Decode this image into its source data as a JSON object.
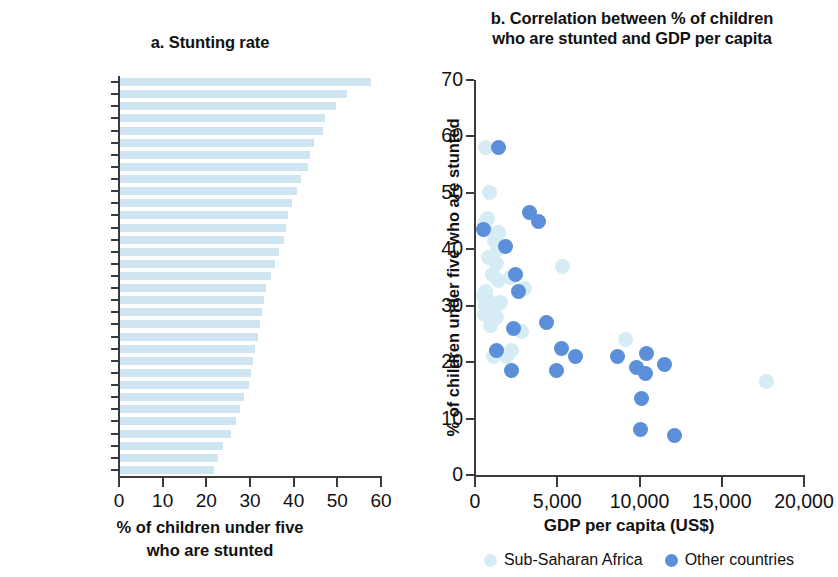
{
  "chart_data": [
    {
      "type": "bar",
      "title": "a. Stunting rate",
      "xlabel": "% of children under five who are stunted",
      "xlabel_lines": [
        "% of children under five",
        "who are stunted"
      ],
      "ylabel": "",
      "orientation": "horizontal",
      "xlim": [
        0,
        60
      ],
      "xticks": [
        0,
        10,
        20,
        30,
        40,
        50,
        60
      ],
      "xticklabels": [
        "0",
        "10",
        "20",
        "30",
        "40",
        "50",
        "60"
      ],
      "grid": false,
      "bar_color": "#cfe6f2",
      "labeled_categories": [
        "Madagascar",
        "Ethiopia",
        "Tanzania",
        "Mali",
        "Nigeria",
        "Lesotho",
        "Liberia",
        "Côte d’Ivoire",
        "Kenya",
        "Namibia",
        "Gabon"
      ],
      "labeled_category_indices": [
        1,
        4,
        7,
        10,
        13,
        16,
        19,
        22,
        25,
        28,
        31
      ],
      "values": [
        57.5,
        52.0,
        49.5,
        47.0,
        46.5,
        44.5,
        43.5,
        43.0,
        41.5,
        40.5,
        39.5,
        38.5,
        38.0,
        37.5,
        36.5,
        35.5,
        34.5,
        33.5,
        33.0,
        32.5,
        32.0,
        31.5,
        31.0,
        30.5,
        30.0,
        29.5,
        28.5,
        27.5,
        26.5,
        25.5,
        23.5,
        22.5,
        21.5
      ]
    },
    {
      "type": "scatter",
      "title": "b. Correlation between % of children who are stunted and GDP per capita",
      "title_lines": [
        "b. Correlation between % of children",
        "who are stunted and GDP per capita"
      ],
      "xlabel": "GDP per capita (US$)",
      "ylabel": "% of children under five who are stunted",
      "xlim": [
        0,
        20000
      ],
      "ylim": [
        0,
        70
      ],
      "xticks": [
        0,
        5000,
        10000,
        15000,
        20000
      ],
      "xticklabels": [
        "0",
        "5,000",
        "10,000",
        "15,000",
        "20,000"
      ],
      "yticks": [
        0,
        10,
        20,
        30,
        40,
        50,
        60,
        70
      ],
      "yticklabels": [
        "0",
        "10",
        "20",
        "30",
        "40",
        "50",
        "60",
        "70"
      ],
      "grid": false,
      "legend_position": "bottom",
      "series": [
        {
          "name": "Sub-Saharan Africa",
          "color": "#d6ecf5",
          "points": [
            [
              700,
              58.0
            ],
            [
              950,
              50.0
            ],
            [
              800,
              45.5
            ],
            [
              620,
              44.5
            ],
            [
              700,
              43.5
            ],
            [
              1500,
              43.0
            ],
            [
              1250,
              41.5
            ],
            [
              1450,
              40.0
            ],
            [
              900,
              38.5
            ],
            [
              1350,
              37.5
            ],
            [
              5400,
              37.0
            ],
            [
              1100,
              35.5
            ],
            [
              2200,
              35.0
            ],
            [
              1500,
              34.5
            ],
            [
              3100,
              33.0
            ],
            [
              700,
              32.5
            ],
            [
              560,
              31.8
            ],
            [
              900,
              31.0
            ],
            [
              1600,
              30.5
            ],
            [
              680,
              30.0
            ],
            [
              1250,
              29.5
            ],
            [
              620,
              28.5
            ],
            [
              1350,
              28.0
            ],
            [
              1000,
              26.5
            ],
            [
              2900,
              25.5
            ],
            [
              9200,
              24.0
            ],
            [
              2300,
              22.0
            ],
            [
              1200,
              21.0
            ],
            [
              1950,
              21.0
            ],
            [
              17800,
              16.5
            ]
          ]
        },
        {
          "name": "Other countries",
          "color": "#5b8fda",
          "points": [
            [
              1500,
              58.0
            ],
            [
              3400,
              46.5
            ],
            [
              3900,
              45.0
            ],
            [
              600,
              43.5
            ],
            [
              1900,
              40.5
            ],
            [
              2550,
              35.5
            ],
            [
              2700,
              32.5
            ],
            [
              4400,
              27.0
            ],
            [
              2400,
              26.0
            ],
            [
              5300,
              22.5
            ],
            [
              1350,
              22.0
            ],
            [
              6200,
              21.0
            ],
            [
              8700,
              21.0
            ],
            [
              10500,
              21.5
            ],
            [
              9900,
              19.0
            ],
            [
              11600,
              19.5
            ],
            [
              2300,
              18.5
            ],
            [
              5000,
              18.5
            ],
            [
              10400,
              18.0
            ],
            [
              10200,
              13.5
            ],
            [
              10100,
              8.0
            ],
            [
              12200,
              7.0
            ]
          ]
        }
      ]
    }
  ]
}
